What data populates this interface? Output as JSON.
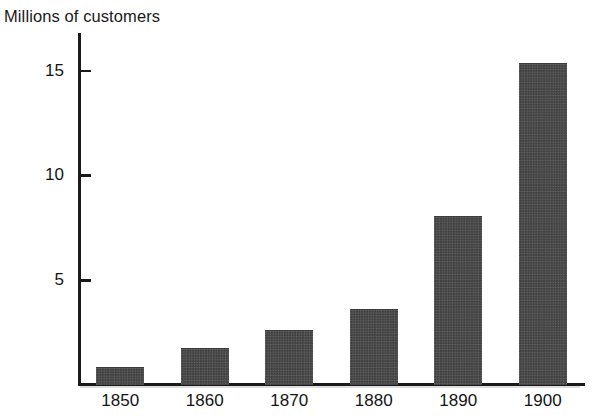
{
  "chart_data": {
    "type": "bar",
    "title": "",
    "ylabel": "Millions of customers",
    "xlabel": "",
    "categories": [
      "1850",
      "1860",
      "1870",
      "1880",
      "1890",
      "1900"
    ],
    "values": [
      0.8,
      1.7,
      2.6,
      3.6,
      8.0,
      15.3
    ],
    "series": [
      {
        "name": "Millions of customers",
        "values": [
          0.8,
          1.7,
          2.6,
          3.6,
          8.0,
          15.3
        ]
      }
    ],
    "ylim": [
      0,
      16.8
    ],
    "xlim": [
      0,
      6
    ],
    "y_ticks": [
      5,
      10,
      15
    ],
    "y_tick_labels": [
      "5",
      "10",
      "15"
    ],
    "grid": false,
    "legend": false,
    "legend_position": "none",
    "bar_color": "#4b4b4b",
    "axis_color": "#1a1a1a",
    "background_color": "#ffffff"
  },
  "axis": {
    "y_caption": "Millions of customers",
    "ticks": [
      {
        "label": "15",
        "value": 15
      },
      {
        "label": "10",
        "value": 10
      },
      {
        "label": "5",
        "value": 5
      }
    ]
  },
  "bars": [
    {
      "label": "1850",
      "value": 0.8
    },
    {
      "label": "1860",
      "value": 1.7
    },
    {
      "label": "1870",
      "value": 2.6
    },
    {
      "label": "1880",
      "value": 3.6
    },
    {
      "label": "1890",
      "value": 8.0
    },
    {
      "label": "1900",
      "value": 15.3
    }
  ]
}
